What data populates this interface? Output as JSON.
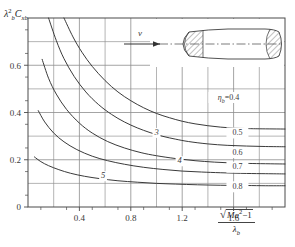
{
  "chart_data": {
    "type": "line",
    "title": "",
    "subtitle": "",
    "ylabel": "λ²b Cxb",
    "xlabel": "√(Ma² − 1) / λb",
    "xlim": [
      0.0,
      2.0
    ],
    "ylim": [
      0.0,
      0.8
    ],
    "xticks": [
      0.4,
      0.8,
      1.2,
      1.6
    ],
    "xtick_labels": [
      "0.4",
      "0.8",
      "1.2",
      "1.6"
    ],
    "yticks": [
      0.0,
      0.2,
      0.4,
      0.6
    ],
    "ytick_labels": [
      "0",
      "0.2",
      "0.4",
      "0.6"
    ],
    "x_minor_step": 0.2,
    "y_minor_step": 0.1,
    "grid": true,
    "legend_position": "inline-right",
    "series": [
      {
        "name": "3",
        "label": "3",
        "label_x": 1.0,
        "label_y": 0.305,
        "points": [
          [
            0.28,
            0.8
          ],
          [
            0.35,
            0.72
          ],
          [
            0.42,
            0.655
          ],
          [
            0.5,
            0.595
          ],
          [
            0.6,
            0.535
          ],
          [
            0.7,
            0.487
          ],
          [
            0.8,
            0.45
          ],
          [
            0.9,
            0.42
          ],
          [
            1.0,
            0.396
          ],
          [
            1.1,
            0.378
          ],
          [
            1.2,
            0.363
          ],
          [
            1.3,
            0.352
          ],
          [
            1.4,
            0.344
          ],
          [
            1.5,
            0.338
          ],
          [
            1.6,
            0.334
          ],
          [
            1.7,
            0.332
          ],
          [
            1.8,
            0.331
          ],
          [
            2.0,
            0.33
          ]
        ]
      },
      {
        "name": "3b",
        "label": "",
        "label_x": null,
        "label_y": null,
        "points": [
          [
            0.16,
            0.8
          ],
          [
            0.22,
            0.705
          ],
          [
            0.28,
            0.628
          ],
          [
            0.36,
            0.552
          ],
          [
            0.45,
            0.487
          ],
          [
            0.55,
            0.433
          ],
          [
            0.65,
            0.392
          ],
          [
            0.75,
            0.36
          ],
          [
            0.85,
            0.335
          ],
          [
            0.95,
            0.315
          ],
          [
            1.05,
            0.299
          ],
          [
            1.15,
            0.287
          ],
          [
            1.25,
            0.277
          ],
          [
            1.4,
            0.267
          ],
          [
            1.55,
            0.261
          ],
          [
            1.7,
            0.258
          ],
          [
            1.85,
            0.256
          ],
          [
            2.0,
            0.255
          ]
        ]
      },
      {
        "name": "4",
        "label": "4",
        "label_x": 1.18,
        "label_y": 0.185,
        "points": [
          [
            0.11,
            0.625
          ],
          [
            0.16,
            0.545
          ],
          [
            0.22,
            0.478
          ],
          [
            0.3,
            0.413
          ],
          [
            0.4,
            0.355
          ],
          [
            0.5,
            0.313
          ],
          [
            0.62,
            0.277
          ],
          [
            0.75,
            0.25
          ],
          [
            0.88,
            0.23
          ],
          [
            1.0,
            0.217
          ],
          [
            1.15,
            0.205
          ],
          [
            1.3,
            0.196
          ],
          [
            1.45,
            0.19
          ],
          [
            1.6,
            0.186
          ],
          [
            1.75,
            0.184
          ],
          [
            2.0,
            0.182
          ]
        ]
      },
      {
        "name": "4b",
        "label": "",
        "label_x": null,
        "label_y": null,
        "points": [
          [
            0.08,
            0.408
          ],
          [
            0.13,
            0.36
          ],
          [
            0.2,
            0.313
          ],
          [
            0.28,
            0.276
          ],
          [
            0.38,
            0.243
          ],
          [
            0.5,
            0.215
          ],
          [
            0.62,
            0.196
          ],
          [
            0.75,
            0.181
          ],
          [
            0.9,
            0.168
          ],
          [
            1.05,
            0.159
          ],
          [
            1.2,
            0.152
          ],
          [
            1.35,
            0.148
          ],
          [
            1.5,
            0.145
          ],
          [
            1.7,
            0.142
          ],
          [
            1.85,
            0.141
          ],
          [
            2.0,
            0.14
          ]
        ]
      },
      {
        "name": "5",
        "label": "5",
        "label_x": 0.585,
        "label_y": 0.122,
        "points": [
          [
            0.05,
            0.212
          ],
          [
            0.1,
            0.192
          ],
          [
            0.16,
            0.175
          ],
          [
            0.24,
            0.158
          ],
          [
            0.33,
            0.143
          ],
          [
            0.44,
            0.13
          ],
          [
            0.56,
            0.12
          ],
          [
            0.7,
            0.111
          ],
          [
            0.85,
            0.105
          ],
          [
            1.0,
            0.1
          ],
          [
            1.15,
            0.097
          ],
          [
            1.32,
            0.094
          ],
          [
            1.5,
            0.092
          ],
          [
            1.7,
            0.091
          ],
          [
            1.85,
            0.09
          ],
          [
            2.0,
            0.09
          ]
        ]
      }
    ],
    "annotations": [
      {
        "text": "ηb=0.4",
        "x": 1.56,
        "y": 0.455,
        "kind": "eta-first"
      },
      {
        "text": "0.5",
        "x": 1.63,
        "y": 0.305,
        "kind": "eta"
      },
      {
        "text": "0.6",
        "x": 1.63,
        "y": 0.222,
        "kind": "eta"
      },
      {
        "text": "0.7",
        "x": 1.63,
        "y": 0.16,
        "kind": "eta"
      },
      {
        "text": "0.8",
        "x": 1.63,
        "y": 0.077,
        "kind": "eta"
      }
    ],
    "inset": {
      "name": "axisymmetric-body-diagram",
      "velocity_label": "v",
      "description": "slender axisymmetric body with hatched nose and hatched base, centerline, flow arrow from left"
    }
  },
  "axis": {
    "y_label_parts": {
      "lambda": "λ",
      "exp": "2",
      "sub_b": "b",
      "c": "C",
      "sub_xb": "xb"
    },
    "x_label_parts": {
      "numerator": "Ma",
      "num_exp": "2",
      "num_tail": "−1",
      "denominator": "λ",
      "den_sub": "b"
    }
  }
}
